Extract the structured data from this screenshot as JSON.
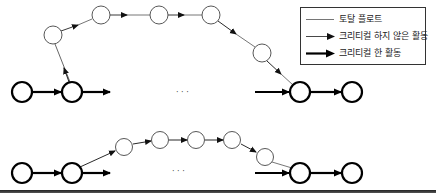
{
  "legend": {
    "items": [
      {
        "label": "토탈 플로트",
        "style": "plain-thin-line"
      },
      {
        "label": "크리티컬 하지 않은 활동",
        "style": "thin-arrow"
      },
      {
        "label": "크리티컬 한 활동",
        "style": "bold-arrow"
      }
    ]
  },
  "diagram": {
    "ellipsis": "· · ·",
    "colors": {
      "critical": "#000000",
      "noncritical": "#333333",
      "float": "#777777"
    },
    "top_network": {
      "critical_nodes": [
        [
          22,
          92
        ],
        [
          72,
          92
        ],
        [
          300,
          92
        ],
        [
          352,
          92
        ]
      ],
      "noncritical_nodes": [
        [
          53,
          35
        ],
        [
          101,
          15
        ],
        [
          159,
          15
        ],
        [
          211,
          15
        ],
        [
          262,
          53
        ]
      ]
    },
    "bottom_network": {
      "critical_nodes": [
        [
          22,
          173
        ],
        [
          72,
          173
        ],
        [
          300,
          173
        ],
        [
          352,
          173
        ]
      ],
      "noncritical_nodes": [
        [
          124,
          147
        ],
        [
          160,
          140
        ],
        [
          196,
          140
        ],
        [
          232,
          140
        ],
        [
          265,
          157
        ]
      ]
    }
  }
}
